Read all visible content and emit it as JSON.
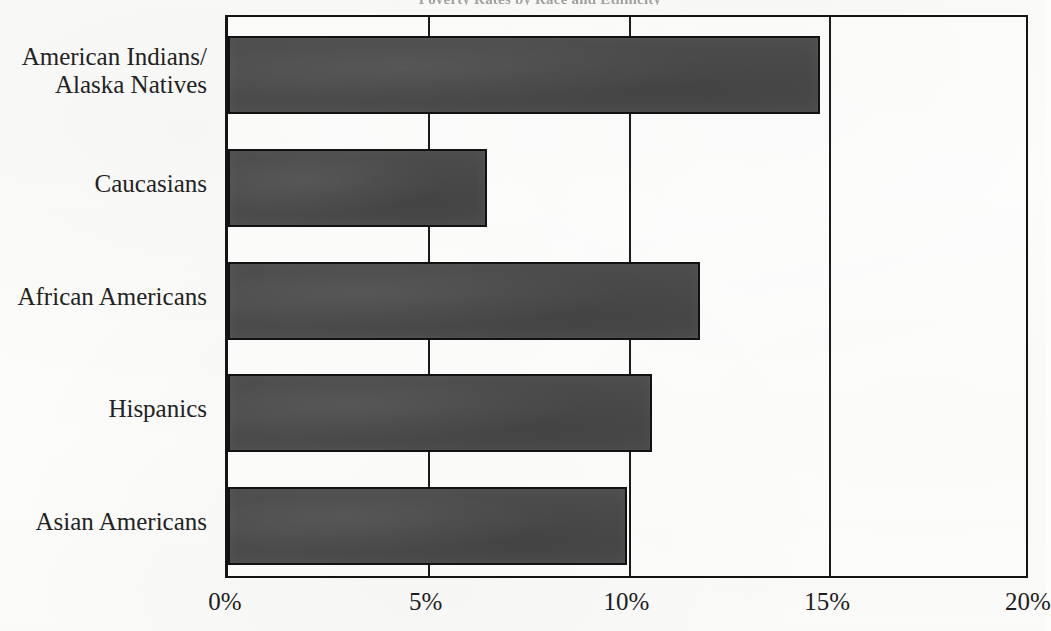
{
  "figure": {
    "clipped_title_fragment": "Poverty Rates by Race and Ethnicity",
    "background_color": "#fdfdfb",
    "bar_color": "#4b4b4b",
    "bar_outline_color": "#121212",
    "axis_color": "#141414",
    "text_color": "#222222"
  },
  "chart_data": {
    "type": "bar",
    "orientation": "horizontal",
    "title": "",
    "xlabel": "",
    "ylabel": "",
    "categories": [
      "American Indians/\nAlaska Natives",
      "Caucasians",
      "African Americans",
      "Hispanics",
      "Asian Americans"
    ],
    "values": [
      14.7,
      6.4,
      11.7,
      10.5,
      9.9
    ],
    "value_unit": "%",
    "xlim": [
      0,
      20
    ],
    "xticks": [
      0,
      5,
      10,
      15,
      20
    ],
    "xtick_labels": [
      "0%",
      "5%",
      "10%",
      "15%",
      "20%"
    ],
    "grid": true,
    "grid_axis": "x",
    "legend": false,
    "legend_position": "none",
    "series": [
      {
        "name": "Percent",
        "values": [
          14.7,
          6.4,
          11.7,
          10.5,
          9.9
        ]
      }
    ]
  }
}
